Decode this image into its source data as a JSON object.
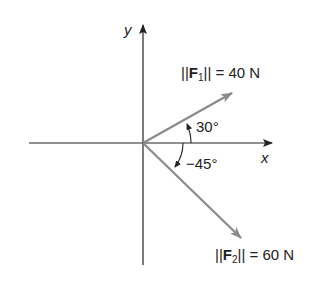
{
  "diagram": {
    "axes": {
      "x_label": "x",
      "y_label": "y"
    },
    "vectors": [
      {
        "name": "F",
        "sub": "1",
        "magnitude_text": "= 40 N",
        "magnitude": 40,
        "unit": "N",
        "angle_deg": 30,
        "angle_label": "30°"
      },
      {
        "name": "F",
        "sub": "2",
        "magnitude_text": "= 60 N",
        "magnitude": 60,
        "unit": "N",
        "angle_deg": -45,
        "angle_label": "−45°"
      }
    ],
    "colors": {
      "axis": "#222222",
      "vector": "#8a8a8a"
    }
  }
}
